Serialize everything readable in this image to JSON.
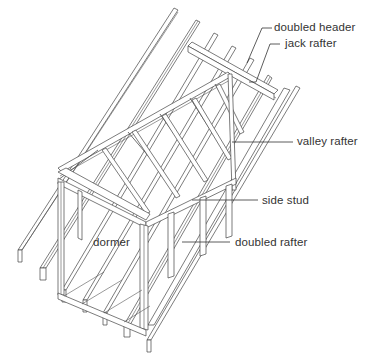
{
  "figure": {
    "type": "isometric framing diagram"
  },
  "labels": [
    {
      "id": "doubled-header",
      "text": "doubled header"
    },
    {
      "id": "jack-rafter",
      "text": "jack rafter"
    },
    {
      "id": "valley-rafter",
      "text": "valley rafter"
    },
    {
      "id": "side-stud",
      "text": "side stud"
    },
    {
      "id": "dormer",
      "text": "dormer"
    },
    {
      "id": "doubled-rafter",
      "text": "doubled rafter"
    }
  ],
  "colors": {
    "line": "#444444",
    "text": "#333333",
    "background": "#ffffff"
  }
}
